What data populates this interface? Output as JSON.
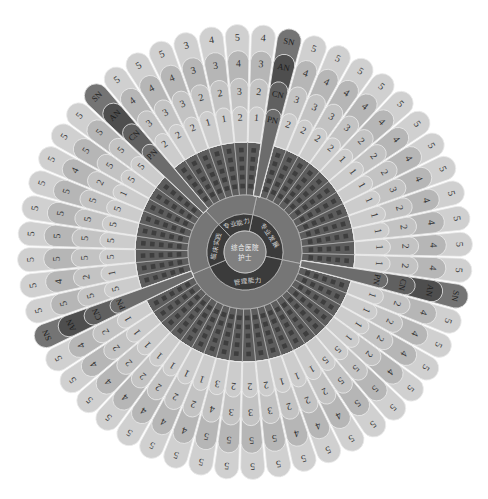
{
  "chart_data": {
    "type": "heatmap",
    "layout": "radial",
    "title": "",
    "center_label": {
      "line1": "综合医院",
      "line2": "护士"
    },
    "levels": [
      "PN",
      "CN",
      "AN",
      "SN"
    ],
    "level_order": "inner-to-outer",
    "value_range": [
      1,
      5
    ],
    "groups": [
      {
        "name": "专业发展",
        "items": [
          [
            2,
            3,
            4,
            5
          ],
          [
            2,
            3,
            4,
            5
          ],
          [
            2,
            3,
            4,
            5
          ],
          [
            2,
            3,
            4,
            5
          ],
          [
            1,
            2,
            4,
            5
          ],
          [
            1,
            2,
            4,
            5
          ],
          [
            1,
            2,
            4,
            5
          ],
          [
            1,
            3,
            4,
            5
          ],
          [
            1,
            2,
            4,
            5
          ],
          [
            1,
            2,
            4,
            5
          ],
          [
            1,
            2,
            4,
            5
          ],
          [
            1,
            2,
            4,
            5
          ]
        ]
      },
      {
        "name": "管理能力",
        "items": [
          [
            1,
            2,
            4,
            5
          ],
          [
            1,
            2,
            4,
            5
          ],
          [
            1,
            2,
            4,
            5
          ],
          [
            1,
            2,
            4,
            5
          ],
          [
            5,
            5,
            5,
            5
          ],
          [
            5,
            5,
            5,
            5
          ],
          [
            1,
            2,
            4,
            5
          ],
          [
            1,
            2,
            4,
            5
          ],
          [
            1,
            2,
            4,
            5
          ],
          [
            2,
            3,
            5,
            5
          ],
          [
            2,
            3,
            5,
            5
          ],
          [
            2,
            3,
            5,
            5
          ],
          [
            3,
            4,
            5,
            5
          ],
          [
            1,
            2,
            4,
            5
          ],
          [
            1,
            2,
            4,
            5
          ],
          [
            1,
            2,
            4,
            5
          ],
          [
            1,
            2,
            4,
            5
          ],
          [
            1,
            2,
            4,
            5
          ],
          [
            1,
            2,
            4,
            5
          ],
          [
            1,
            2,
            4,
            5
          ]
        ]
      },
      {
        "name": "临床实践",
        "items": [
          [
            5,
            5,
            5,
            5
          ],
          [
            1,
            2,
            4,
            5
          ],
          [
            5,
            5,
            5,
            5
          ],
          [
            5,
            5,
            5,
            5
          ],
          [
            5,
            5,
            5,
            5
          ],
          [
            5,
            5,
            5,
            5
          ],
          [
            1,
            2,
            4,
            5
          ],
          [
            5,
            5,
            5,
            5
          ],
          [
            5,
            5,
            5,
            5
          ]
        ]
      },
      {
        "name": "专业能力",
        "items": [
          [
            2,
            3,
            4,
            5
          ],
          [
            2,
            3,
            4,
            5
          ],
          [
            2,
            3,
            4,
            5
          ],
          [
            1,
            2,
            3,
            3
          ],
          [
            1,
            2,
            3,
            4
          ],
          [
            2,
            3,
            4,
            5
          ],
          [
            1,
            2,
            3,
            4
          ]
        ]
      }
    ]
  },
  "colors": {
    "levels": [
      "#cccccc",
      "#c3c3c3",
      "#b6b6b6",
      "#d0d0d0"
    ],
    "legend_spoke": [
      "#6c6c6c",
      "#606060",
      "#4e4e4e",
      "#747474"
    ],
    "item_ring": "#5d5d5d",
    "item_text": "#3e3e3e",
    "sub_ring": "#767676",
    "category_ring": "#3b3b3b",
    "center": "#808080",
    "ring_line": "#b9b9b9",
    "petal_line": "#ececec"
  }
}
